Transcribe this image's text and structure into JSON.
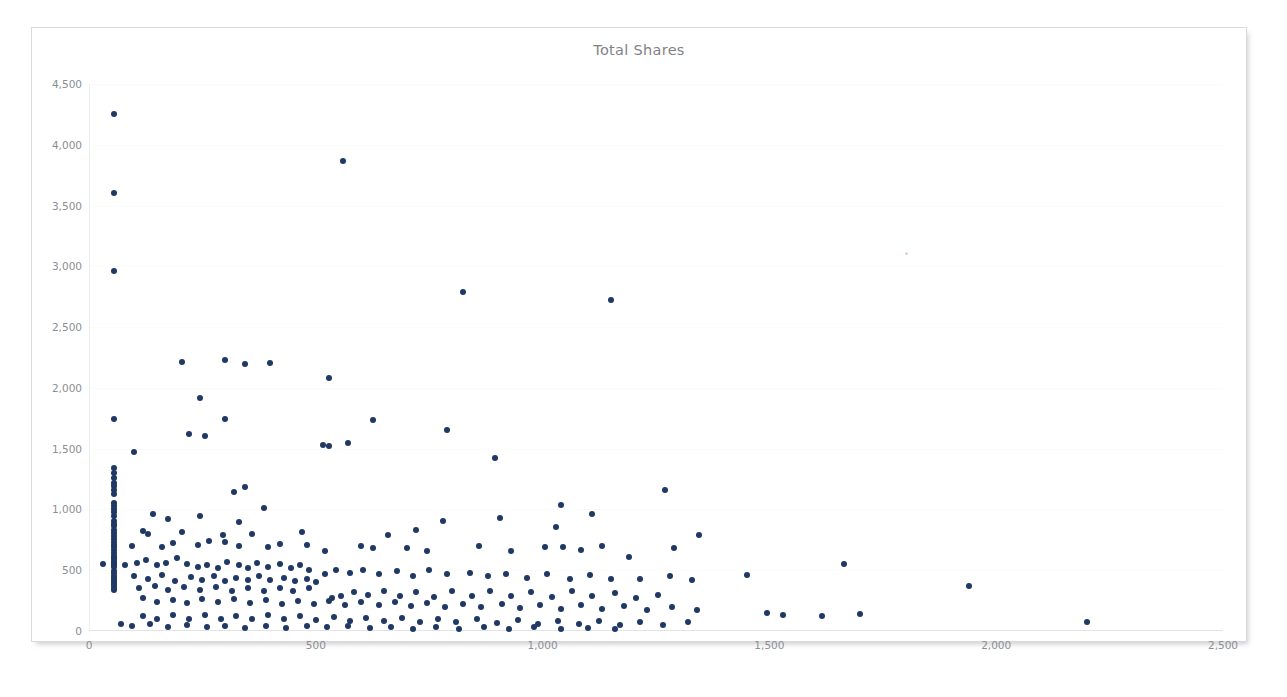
{
  "card": {
    "title": "Total Shares"
  },
  "chart_data": {
    "type": "scatter",
    "title": "Total Shares",
    "xlabel": "",
    "ylabel": "",
    "xlim": [
      0,
      2500
    ],
    "ylim": [
      0,
      4500
    ],
    "xticks": [
      0,
      500,
      1000,
      1500,
      2000,
      2500
    ],
    "xtick_labels": [
      "0",
      "500",
      "1,000",
      "1,500",
      "2,000",
      "2,500"
    ],
    "yticks": [
      0,
      500,
      1000,
      1500,
      2000,
      2500,
      3000,
      3500,
      4000,
      4500
    ],
    "ytick_labels": [
      "0",
      "500",
      "1,000",
      "1,500",
      "2,000",
      "2,500",
      "3,000",
      "3,500",
      "4,000",
      "4,500"
    ],
    "grid": "horizontal-faint",
    "legend": null,
    "marker_color": "#1F3864",
    "marker_size_px": 6,
    "points": [
      [
        55,
        4250
      ],
      [
        55,
        3600
      ],
      [
        55,
        2960
      ],
      [
        560,
        3870
      ],
      [
        825,
        2790
      ],
      [
        1150,
        2720
      ],
      [
        205,
        2210
      ],
      [
        300,
        2230
      ],
      [
        345,
        2195
      ],
      [
        400,
        2205
      ],
      [
        530,
        2085
      ],
      [
        245,
        1915
      ],
      [
        55,
        1745
      ],
      [
        300,
        1745
      ],
      [
        625,
        1735
      ],
      [
        220,
        1620
      ],
      [
        255,
        1605
      ],
      [
        790,
        1650
      ],
      [
        515,
        1530
      ],
      [
        530,
        1520
      ],
      [
        570,
        1545
      ],
      [
        100,
        1470
      ],
      [
        895,
        1420
      ],
      [
        55,
        1345
      ],
      [
        55,
        1300
      ],
      [
        55,
        1260
      ],
      [
        55,
        1215
      ],
      [
        55,
        1190
      ],
      [
        55,
        1160
      ],
      [
        55,
        1125
      ],
      [
        345,
        1185
      ],
      [
        320,
        1140
      ],
      [
        1270,
        1160
      ],
      [
        1040,
        1040
      ],
      [
        55,
        1055
      ],
      [
        55,
        1030
      ],
      [
        55,
        1000
      ],
      [
        55,
        975
      ],
      [
        55,
        950
      ],
      [
        140,
        960
      ],
      [
        175,
        920
      ],
      [
        245,
        950
      ],
      [
        330,
        895
      ],
      [
        385,
        1010
      ],
      [
        1110,
        965
      ],
      [
        905,
        930
      ],
      [
        780,
        905
      ],
      [
        55,
        905
      ],
      [
        55,
        880
      ],
      [
        55,
        860
      ],
      [
        55,
        830
      ],
      [
        55,
        805
      ],
      [
        55,
        780
      ],
      [
        120,
        820
      ],
      [
        130,
        800
      ],
      [
        205,
        815
      ],
      [
        295,
        790
      ],
      [
        360,
        800
      ],
      [
        470,
        815
      ],
      [
        660,
        790
      ],
      [
        720,
        835
      ],
      [
        1030,
        855
      ],
      [
        1045,
        690
      ],
      [
        1345,
        790
      ],
      [
        55,
        760
      ],
      [
        55,
        735
      ],
      [
        55,
        710
      ],
      [
        55,
        690
      ],
      [
        55,
        665
      ],
      [
        55,
        645
      ],
      [
        95,
        700
      ],
      [
        160,
        690
      ],
      [
        185,
        725
      ],
      [
        240,
        705
      ],
      [
        265,
        740
      ],
      [
        300,
        730
      ],
      [
        330,
        700
      ],
      [
        395,
        690
      ],
      [
        420,
        715
      ],
      [
        480,
        705
      ],
      [
        520,
        660
      ],
      [
        600,
        700
      ],
      [
        625,
        680
      ],
      [
        700,
        680
      ],
      [
        745,
        660
      ],
      [
        860,
        700
      ],
      [
        930,
        660
      ],
      [
        1005,
        690
      ],
      [
        1085,
        670
      ],
      [
        1130,
        700
      ],
      [
        1290,
        685
      ],
      [
        1190,
        610
      ],
      [
        55,
        620
      ],
      [
        55,
        600
      ],
      [
        55,
        585
      ],
      [
        55,
        570
      ],
      [
        55,
        555
      ],
      [
        55,
        540
      ],
      [
        55,
        525
      ],
      [
        30,
        555
      ],
      [
        80,
        545
      ],
      [
        105,
        560
      ],
      [
        125,
        580
      ],
      [
        150,
        545
      ],
      [
        170,
        560
      ],
      [
        195,
        600
      ],
      [
        215,
        555
      ],
      [
        240,
        530
      ],
      [
        260,
        545
      ],
      [
        285,
        520
      ],
      [
        305,
        565
      ],
      [
        330,
        540
      ],
      [
        350,
        520
      ],
      [
        370,
        560
      ],
      [
        395,
        530
      ],
      [
        420,
        555
      ],
      [
        445,
        520
      ],
      [
        465,
        545
      ],
      [
        485,
        500
      ],
      [
        520,
        470
      ],
      [
        545,
        500
      ],
      [
        575,
        480
      ],
      [
        605,
        500
      ],
      [
        640,
        470
      ],
      [
        680,
        490
      ],
      [
        715,
        450
      ],
      [
        750,
        500
      ],
      [
        790,
        470
      ],
      [
        840,
        480
      ],
      [
        880,
        455
      ],
      [
        920,
        470
      ],
      [
        965,
        440
      ],
      [
        1010,
        470
      ],
      [
        1060,
        430
      ],
      [
        1105,
        460
      ],
      [
        1150,
        430
      ],
      [
        1215,
        430
      ],
      [
        1280,
        450
      ],
      [
        1330,
        420
      ],
      [
        1450,
        460
      ],
      [
        1665,
        550
      ],
      [
        1940,
        370
      ],
      [
        55,
        495
      ],
      [
        55,
        475
      ],
      [
        55,
        455
      ],
      [
        55,
        435
      ],
      [
        55,
        420
      ],
      [
        100,
        450
      ],
      [
        130,
        430
      ],
      [
        160,
        460
      ],
      [
        190,
        415
      ],
      [
        225,
        445
      ],
      [
        250,
        420
      ],
      [
        275,
        450
      ],
      [
        300,
        410
      ],
      [
        325,
        440
      ],
      [
        350,
        420
      ],
      [
        375,
        455
      ],
      [
        400,
        420
      ],
      [
        430,
        440
      ],
      [
        455,
        410
      ],
      [
        480,
        430
      ],
      [
        500,
        400
      ],
      [
        535,
        270
      ],
      [
        555,
        290
      ],
      [
        585,
        320
      ],
      [
        615,
        300
      ],
      [
        650,
        330
      ],
      [
        685,
        290
      ],
      [
        720,
        320
      ],
      [
        760,
        280
      ],
      [
        800,
        330
      ],
      [
        845,
        290
      ],
      [
        885,
        330
      ],
      [
        930,
        290
      ],
      [
        975,
        320
      ],
      [
        1020,
        280
      ],
      [
        1065,
        330
      ],
      [
        1110,
        290
      ],
      [
        1160,
        310
      ],
      [
        1205,
        270
      ],
      [
        1255,
        300
      ],
      [
        55,
        400
      ],
      [
        55,
        385
      ],
      [
        55,
        370
      ],
      [
        55,
        355
      ],
      [
        55,
        340
      ],
      [
        110,
        350
      ],
      [
        145,
        370
      ],
      [
        175,
        340
      ],
      [
        210,
        365
      ],
      [
        245,
        335
      ],
      [
        280,
        360
      ],
      [
        315,
        330
      ],
      [
        350,
        355
      ],
      [
        385,
        330
      ],
      [
        420,
        350
      ],
      [
        450,
        325
      ],
      [
        485,
        350
      ],
      [
        120,
        270
      ],
      [
        150,
        240
      ],
      [
        185,
        255
      ],
      [
        215,
        230
      ],
      [
        250,
        265
      ],
      [
        285,
        235
      ],
      [
        320,
        260
      ],
      [
        355,
        230
      ],
      [
        390,
        255
      ],
      [
        425,
        225
      ],
      [
        460,
        250
      ],
      [
        495,
        220
      ],
      [
        530,
        245
      ],
      [
        565,
        215
      ],
      [
        600,
        240
      ],
      [
        640,
        210
      ],
      [
        675,
        235
      ],
      [
        710,
        205
      ],
      [
        745,
        230
      ],
      [
        785,
        200
      ],
      [
        825,
        225
      ],
      [
        865,
        195
      ],
      [
        910,
        220
      ],
      [
        950,
        190
      ],
      [
        995,
        215
      ],
      [
        1040,
        185
      ],
      [
        1085,
        210
      ],
      [
        1130,
        180
      ],
      [
        1180,
        205
      ],
      [
        1230,
        175
      ],
      [
        1285,
        200
      ],
      [
        1340,
        175
      ],
      [
        1495,
        150
      ],
      [
        1530,
        130
      ],
      [
        1615,
        125
      ],
      [
        1700,
        140
      ],
      [
        2200,
        75
      ],
      [
        120,
        120
      ],
      [
        150,
        95
      ],
      [
        185,
        135
      ],
      [
        220,
        100
      ],
      [
        255,
        130
      ],
      [
        290,
        95
      ],
      [
        325,
        125
      ],
      [
        360,
        100
      ],
      [
        395,
        130
      ],
      [
        430,
        95
      ],
      [
        465,
        120
      ],
      [
        500,
        90
      ],
      [
        540,
        115
      ],
      [
        575,
        85
      ],
      [
        610,
        110
      ],
      [
        650,
        80
      ],
      [
        690,
        105
      ],
      [
        730,
        75
      ],
      [
        770,
        100
      ],
      [
        810,
        70
      ],
      [
        855,
        95
      ],
      [
        900,
        65
      ],
      [
        945,
        90
      ],
      [
        990,
        60
      ],
      [
        1035,
        85
      ],
      [
        1080,
        55
      ],
      [
        1125,
        80
      ],
      [
        1170,
        50
      ],
      [
        1215,
        75
      ],
      [
        1265,
        50
      ],
      [
        1320,
        70
      ],
      [
        70,
        60
      ],
      [
        95,
        40
      ],
      [
        135,
        55
      ],
      [
        175,
        35
      ],
      [
        215,
        50
      ],
      [
        260,
        30
      ],
      [
        300,
        45
      ],
      [
        345,
        25
      ],
      [
        390,
        40
      ],
      [
        435,
        25
      ],
      [
        480,
        45
      ],
      [
        525,
        30
      ],
      [
        570,
        40
      ],
      [
        620,
        25
      ],
      [
        665,
        35
      ],
      [
        715,
        20
      ],
      [
        765,
        35
      ],
      [
        815,
        20
      ],
      [
        870,
        30
      ],
      [
        925,
        20
      ],
      [
        980,
        30
      ],
      [
        1040,
        15
      ],
      [
        1100,
        25
      ],
      [
        1160,
        15
      ]
    ]
  }
}
